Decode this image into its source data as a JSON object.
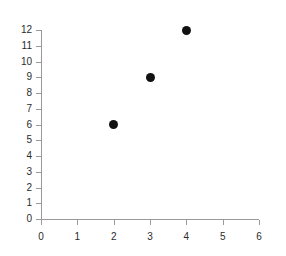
{
  "chart_data": {
    "type": "scatter",
    "title": "",
    "subtitle": "",
    "xlabel": "",
    "ylabel": "",
    "x": [
      2,
      3,
      4
    ],
    "values": [
      6,
      9,
      12
    ],
    "points": [
      {
        "x": 2,
        "y": 6
      },
      {
        "x": 3,
        "y": 9
      },
      {
        "x": 4,
        "y": 12
      }
    ],
    "xlim": [
      0,
      6
    ],
    "ylim": [
      0,
      12
    ],
    "xticks": [
      0,
      1,
      2,
      3,
      4,
      5,
      6
    ],
    "yticks": [
      0,
      1,
      2,
      3,
      4,
      5,
      6,
      7,
      8,
      9,
      10,
      11,
      12
    ],
    "xtick_labels": [
      "0",
      "1",
      "2",
      "3",
      "4",
      "5",
      "6"
    ],
    "ytick_labels": [
      "0",
      "1",
      "2",
      "3",
      "4",
      "5",
      "6",
      "7",
      "8",
      "9",
      "10",
      "11",
      "12"
    ],
    "grid": false,
    "legend": null,
    "legend_position": "none",
    "marker": "filled-circle",
    "marker_color": "#111111",
    "axis_color": "#9a9a9a",
    "label_color": "#2b2b2b",
    "background_color": "#ffffff"
  }
}
